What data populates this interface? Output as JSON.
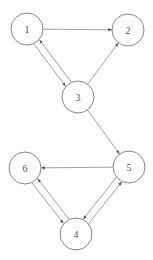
{
  "diagram": {
    "type": "directed-graph",
    "nodes": [
      {
        "id": "1",
        "label": "1",
        "x": 27,
        "y": 29
      },
      {
        "id": "2",
        "label": "2",
        "x": 128,
        "y": 30
      },
      {
        "id": "3",
        "label": "3",
        "x": 78,
        "y": 97
      },
      {
        "id": "4",
        "label": "4",
        "x": 76,
        "y": 234
      },
      {
        "id": "5",
        "label": "5",
        "x": 129,
        "y": 167
      },
      {
        "id": "6",
        "label": "6",
        "x": 25,
        "y": 168
      }
    ],
    "edges": [
      {
        "from": "1",
        "to": "2"
      },
      {
        "from": "1",
        "to": "3"
      },
      {
        "from": "3",
        "to": "1"
      },
      {
        "from": "3",
        "to": "2"
      },
      {
        "from": "3",
        "to": "5"
      },
      {
        "from": "5",
        "to": "6"
      },
      {
        "from": "6",
        "to": "4"
      },
      {
        "from": "4",
        "to": "6"
      },
      {
        "from": "5",
        "to": "4"
      },
      {
        "from": "4",
        "to": "5"
      }
    ],
    "colors": {
      "stroke": "#777777",
      "label": "#555555",
      "background": "#ffffff"
    }
  }
}
